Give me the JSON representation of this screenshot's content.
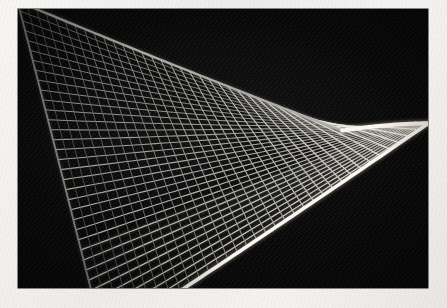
{
  "media": {
    "kind": "photograph",
    "subject": "hyperbolic-paraboloid-wireframe-model",
    "alt_text": "Black and white photograph of a saddle-shaped hyperbolic paraboloid string/wire mesh model on a black background",
    "caption": "",
    "border_color": "#f2f0ed",
    "background_color": "#070707",
    "mesh_color": "#f0ede6"
  },
  "photo": {
    "x": 18,
    "y": 9,
    "width": 410,
    "height": 279
  },
  "chart_data": {
    "type": "scatter",
    "title": "",
    "subtitle": "",
    "xlabel": "",
    "ylabel": "",
    "surface": "hyperbolic paraboloid z = (x^2 - y^2)",
    "ruling_families": 2,
    "lines_per_family": 34,
    "u_range": [
      -1,
      1
    ],
    "v_range": [
      -1,
      1
    ],
    "projection": {
      "note": "oblique view, left lobe in shadow, right lobe lit",
      "center_x": 205,
      "center_y": 140,
      "scale_x": 168,
      "scale_y": 86,
      "saddle_lift": 92,
      "tilt": 0.3
    },
    "rim_highlight": true,
    "legend": [],
    "annotations": []
  }
}
